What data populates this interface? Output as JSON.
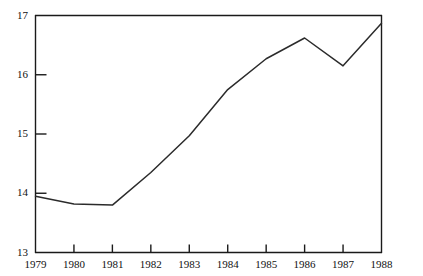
{
  "figure": {
    "top_fragment": "",
    "background": "#ffffff",
    "line_color": "#2b2b2b",
    "axis_color": "#1a1a1a"
  },
  "chart_data": {
    "type": "line",
    "title": "",
    "subtitle": "",
    "xlabel": "",
    "ylabel": "",
    "categories": [
      "1979",
      "1980",
      "1981",
      "1982",
      "1983",
      "1984",
      "1985",
      "1986",
      "1987",
      "1988"
    ],
    "x": [
      1979,
      1980,
      1981,
      1982,
      1983,
      1984,
      1985,
      1986,
      1987,
      1988
    ],
    "values": [
      13.95,
      13.82,
      13.8,
      14.35,
      14.97,
      15.75,
      16.27,
      16.62,
      16.15,
      16.87
    ],
    "series": [
      {
        "name": "series-1",
        "values": [
          13.95,
          13.82,
          13.8,
          14.35,
          14.97,
          15.75,
          16.27,
          16.62,
          16.15,
          16.87
        ]
      }
    ],
    "xlim": [
      1979,
      1988
    ],
    "ylim": [
      13,
      17
    ],
    "ytick_labels": [
      "13",
      "14",
      "15",
      "16",
      "17"
    ],
    "yticks": [
      13,
      14,
      15,
      16,
      17
    ],
    "xtick_labels": [
      "1979",
      "1980",
      "1981",
      "1982",
      "1983",
      "1984",
      "1985",
      "1986",
      "1987",
      "1988"
    ],
    "grid": false,
    "legend": "none",
    "annotations": []
  }
}
